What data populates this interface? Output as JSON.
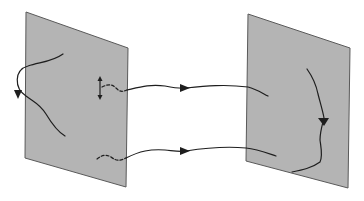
{
  "diagram": {
    "colors": {
      "background": "#ffffff",
      "plane_fill": "#b4b4b4",
      "plane_edge": "#5a5a5a",
      "curve": "#1e1e1e"
    },
    "planes": [
      {
        "id": "left-plane",
        "points": "26,12 128,48 126,187 25,158"
      },
      {
        "id": "right-plane",
        "points": "248,14 350,48 348,188 246,161"
      }
    ],
    "curves": [
      {
        "id": "left-loop-curve",
        "d": "M63,54 C52,62 40,62 28,66 C14,70 14,88 26,96 C34,102 40,104 46,114 C52,124 58,132 65,136",
        "dashed": false
      },
      {
        "id": "upper-dashed-connector",
        "d": "M102,87 C108,84 112,84 116,88 C120,92 122,92 127,90",
        "dashed": true
      },
      {
        "id": "upper-connector",
        "d": "M127,90 C140,87 150,84 165,86 C175,88 180,89 186,88 C205,86 225,84 248,87 C256,89 262,93 268,96",
        "dashed": false
      },
      {
        "id": "lower-dashed-connector",
        "d": "M97,159 C102,155 106,154 111,157 C116,161 120,161 126,158",
        "dashed": true
      },
      {
        "id": "lower-connector",
        "d": "M126,158 C140,151 150,149 165,150 C175,151 180,152 186,151 C205,148 225,146 246,148 C256,149 264,152 276,156",
        "dashed": false
      },
      {
        "id": "right-vertical-curve",
        "d": "M307,69 C312,76 316,84 318,94 C320,102 323,112 324,118 C322,126 320,132 320,140 C321,148 323,156 320,162 C312,168 302,170 292,172",
        "dashed": false
      }
    ],
    "arrowheads": [
      {
        "id": "left-loop-arrow",
        "points": "14,90 22,90 18,99"
      },
      {
        "id": "upper-connector-arrow",
        "points": "180,84 190,88 180,92"
      },
      {
        "id": "lower-connector-arrow",
        "points": "180,147 190,151 180,155"
      },
      {
        "id": "right-curve-arrow",
        "points": "318,118 329,118 324,126"
      }
    ],
    "double_arrow": {
      "id": "vertical-double-arrow",
      "x": 100,
      "y1": 76,
      "y2": 100
    }
  }
}
